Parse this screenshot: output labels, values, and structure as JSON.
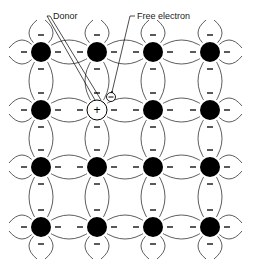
{
  "labels": {
    "donor": "Donor",
    "free_electron": "Free electron"
  },
  "symbols": {
    "donor_charge": "+",
    "electron_charge": "−",
    "bond_electron": "−"
  },
  "lattice": {
    "columns_x": [
      41,
      97,
      153,
      210
    ],
    "rows_y": [
      52,
      110,
      167,
      227
    ],
    "atom_radius": 10,
    "donor": {
      "row": 1,
      "col": 1
    },
    "free_electron": {
      "x": 111,
      "y": 97
    }
  },
  "colors": {
    "atom": "#000000",
    "line": "#333333",
    "background": "#ffffff"
  }
}
